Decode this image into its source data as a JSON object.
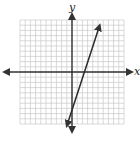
{
  "chart_data": {
    "type": "line",
    "title": "",
    "xlabel": "x",
    "ylabel": "y",
    "xlim": [
      -10,
      10
    ],
    "ylim": [
      -10,
      10
    ],
    "grid": true,
    "grid_step": 1,
    "series": [
      {
        "name": "line",
        "equation": "y = 3x - 7",
        "x": [
          -1,
          5.33
        ],
        "y": [
          -10,
          9
        ]
      }
    ]
  },
  "labels": {
    "x_axis": "x",
    "y_axis": "y"
  },
  "colors": {
    "grid": "#c8c8c8",
    "axis": "#333333",
    "line": "#2a2a2a"
  }
}
